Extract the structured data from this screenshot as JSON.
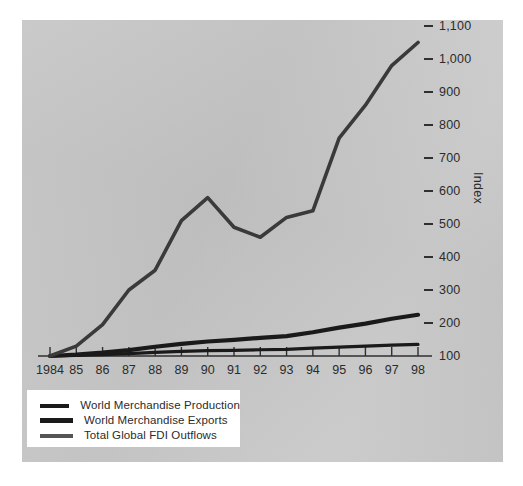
{
  "chart_data": {
    "type": "line",
    "title": "",
    "xlabel": "",
    "ylabel": "Index",
    "x": [
      1984,
      1985,
      1986,
      1987,
      1988,
      1989,
      1990,
      1991,
      1992,
      1993,
      1994,
      1995,
      1996,
      1997,
      1998
    ],
    "xtick_labels": [
      "1984",
      "85",
      "86",
      "87",
      "88",
      "89",
      "90",
      "91",
      "92",
      "93",
      "94",
      "95",
      "96",
      "97",
      "98"
    ],
    "ytick_labels": [
      "1,100",
      "1,000",
      "900",
      "800",
      "700",
      "600",
      "500",
      "400",
      "300",
      "200",
      "100"
    ],
    "ytick_values": [
      1100,
      1000,
      900,
      800,
      700,
      600,
      500,
      400,
      300,
      200,
      100
    ],
    "ylim": [
      100,
      1140
    ],
    "xlim": [
      1984,
      1998
    ],
    "grid": false,
    "legend_position": "bottom-left",
    "series": [
      {
        "name": "World Merchandise Production",
        "color": "#1a1a1a",
        "width": 3.2,
        "values": [
          100,
          102,
          104,
          107,
          111,
          114,
          116,
          117,
          119,
          120,
          124,
          127,
          130,
          133,
          135
        ]
      },
      {
        "name": "World Merchandise Exports",
        "color": "#1a1a1a",
        "width": 4.2,
        "values": [
          100,
          104,
          110,
          118,
          128,
          137,
          144,
          149,
          155,
          160,
          172,
          186,
          198,
          213,
          225
        ]
      },
      {
        "name": "Total Global FDI Outflows",
        "color": "#3a3a3a",
        "width": 3.6,
        "values": [
          100,
          130,
          195,
          300,
          360,
          510,
          580,
          490,
          460,
          520,
          540,
          760,
          860,
          980,
          1050
        ]
      }
    ]
  },
  "axis": {
    "y_title": "Index"
  },
  "legend": {
    "entries": [
      {
        "label": "World Merchandise Production",
        "color": "#1a1a1a",
        "thickness": 4
      },
      {
        "label": "World Merchandise Exports",
        "color": "#1a1a1a",
        "thickness": 5
      },
      {
        "label": "Total Global FDI Outflows",
        "color": "#555555",
        "thickness": 4
      }
    ]
  },
  "colors": {
    "panel_background": "#c8c8c8",
    "page_background": "#ffffff",
    "axis": "#2f2f2f",
    "text": "#2b2b2b"
  }
}
